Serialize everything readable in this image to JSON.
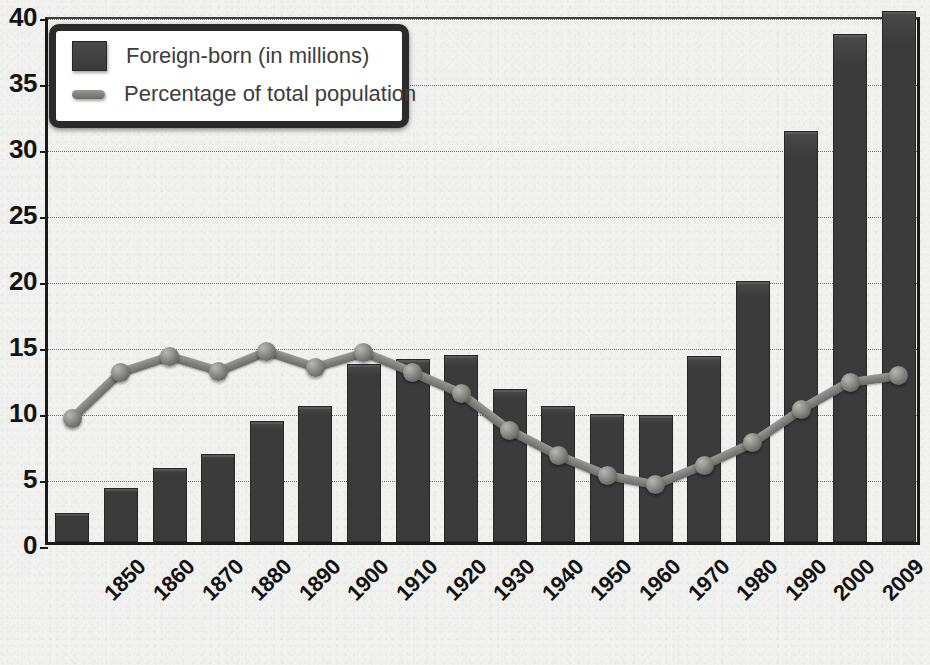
{
  "chart_data": {
    "type": "bar",
    "title": "",
    "xlabel": "",
    "ylabel": "",
    "ylim": [
      0,
      40
    ],
    "yticks": [
      0,
      5,
      10,
      15,
      20,
      25,
      30,
      35,
      40
    ],
    "grid": true,
    "legend_position": "top-left",
    "categories": [
      "1850",
      "1860",
      "1870",
      "1880",
      "1890",
      "1900",
      "1910",
      "1920",
      "1930",
      "1940",
      "1950",
      "1960",
      "1970",
      "1980",
      "1990",
      "2000",
      "2009",
      "2020"
    ],
    "category_sublabels": [
      "",
      "",
      "",
      "",
      "",
      "",
      "",
      "",
      "",
      "",
      "",
      "",
      "",
      "",
      "",
      "",
      "",
      "(projected)"
    ],
    "series": [
      {
        "name": "Foreign-born (in millions)",
        "type": "bar",
        "color": "#3a3a3a",
        "values": [
          2.2,
          4.1,
          5.6,
          6.7,
          9.2,
          10.3,
          13.5,
          13.9,
          14.2,
          11.6,
          10.3,
          9.7,
          9.6,
          14.1,
          19.8,
          31.1,
          38.5,
          40.2
        ]
      },
      {
        "name": "Percentage of total population",
        "type": "line",
        "color": "#83837f",
        "values": [
          9.7,
          13.2,
          14.4,
          13.3,
          14.8,
          13.6,
          14.7,
          13.2,
          11.6,
          8.8,
          6.9,
          5.4,
          4.7,
          6.2,
          7.9,
          10.4,
          12.5,
          13.0
        ]
      }
    ]
  },
  "legend": {
    "items": [
      {
        "label": "Foreign-born (in millions)",
        "marker": "bar-swatch"
      },
      {
        "label": "Percentage of total population",
        "marker": "line-swatch"
      }
    ]
  },
  "axis": {
    "y_labels": [
      "0",
      "5",
      "10",
      "15",
      "20",
      "25",
      "30",
      "35",
      "40"
    ],
    "x_labels": [
      "1850",
      "1860",
      "1870",
      "1880",
      "1890",
      "1900",
      "1910",
      "1920",
      "1930",
      "1940",
      "1950",
      "1960",
      "1970",
      "1980",
      "1990",
      "2000",
      "2009",
      "2020"
    ],
    "x_sublabels": [
      "",
      "",
      "",
      "",
      "",
      "",
      "",
      "",
      "",
      "",
      "",
      "",
      "",
      "",
      "",
      "",
      "",
      "(projected)"
    ]
  },
  "colors": {
    "bar": "#3a3a3a",
    "line": "#83837f",
    "background": "#f1f1ef",
    "axis": "#1a1a1a",
    "grid": "#6e6e6e",
    "legend_border": "#2b2b2b",
    "text": "#121212"
  }
}
